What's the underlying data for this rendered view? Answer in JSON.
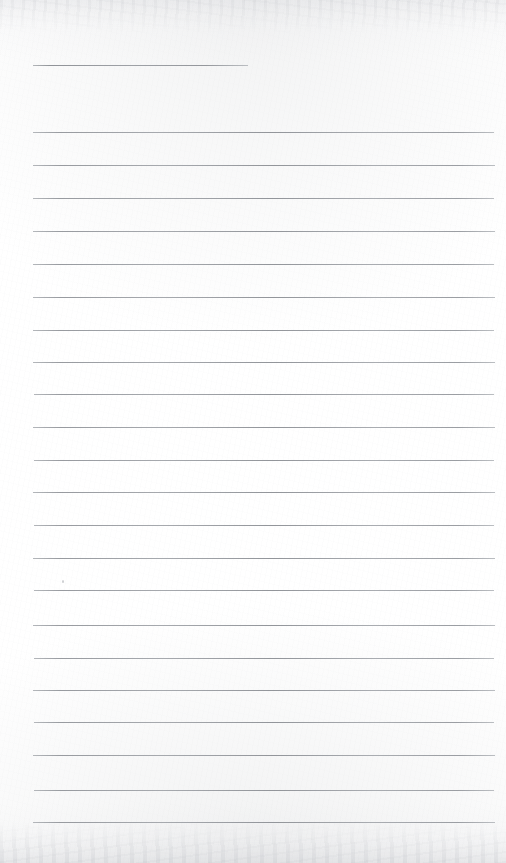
{
  "page": {
    "kind": "scanned-blank-lined-paper",
    "width": 506,
    "height": 863,
    "paper_color": "#fefefe",
    "rule_color": "#969ba0",
    "text_content": "",
    "notes_visible": "none"
  },
  "rules": {
    "count": 23,
    "left_x": 33,
    "right_x": 495,
    "spacing_px": 32.8,
    "lines": [
      {
        "id": "rule-1",
        "y": 65,
        "x1": 33,
        "x2": 248,
        "style": "short"
      },
      {
        "id": "rule-2",
        "y": 132,
        "x1": 33,
        "x2": 494,
        "style": "full"
      },
      {
        "id": "rule-3",
        "y": 165,
        "x1": 33,
        "x2": 495,
        "style": "full"
      },
      {
        "id": "rule-4",
        "y": 198,
        "x1": 33,
        "x2": 494,
        "style": "full"
      },
      {
        "id": "rule-5",
        "y": 231,
        "x1": 33,
        "x2": 495,
        "style": "full"
      },
      {
        "id": "rule-6",
        "y": 264,
        "x1": 33,
        "x2": 494,
        "style": "full"
      },
      {
        "id": "rule-7",
        "y": 297,
        "x1": 33,
        "x2": 495,
        "style": "full"
      },
      {
        "id": "rule-8",
        "y": 330,
        "x1": 33,
        "x2": 494,
        "style": "full"
      },
      {
        "id": "rule-9",
        "y": 362,
        "x1": 33,
        "x2": 495,
        "style": "full"
      },
      {
        "id": "rule-10",
        "y": 394,
        "x1": 34,
        "x2": 494,
        "style": "full"
      },
      {
        "id": "rule-11",
        "y": 427,
        "x1": 33,
        "x2": 495,
        "style": "full"
      },
      {
        "id": "rule-12",
        "y": 460,
        "x1": 34,
        "x2": 494,
        "style": "full"
      },
      {
        "id": "rule-13",
        "y": 492,
        "x1": 33,
        "x2": 495,
        "style": "full"
      },
      {
        "id": "rule-14",
        "y": 525,
        "x1": 34,
        "x2": 494,
        "style": "full"
      },
      {
        "id": "rule-15",
        "y": 558,
        "x1": 33,
        "x2": 495,
        "style": "full"
      },
      {
        "id": "rule-16",
        "y": 590,
        "x1": 34,
        "x2": 494,
        "style": "full"
      },
      {
        "id": "rule-17",
        "y": 625,
        "x1": 33,
        "x2": 495,
        "style": "full"
      },
      {
        "id": "rule-18",
        "y": 658,
        "x1": 34,
        "x2": 494,
        "style": "full"
      },
      {
        "id": "rule-19",
        "y": 690,
        "x1": 33,
        "x2": 495,
        "style": "full"
      },
      {
        "id": "rule-20",
        "y": 722,
        "x1": 34,
        "x2": 494,
        "style": "full"
      },
      {
        "id": "rule-21",
        "y": 755,
        "x1": 33,
        "x2": 495,
        "style": "full"
      },
      {
        "id": "rule-22",
        "y": 790,
        "x1": 34,
        "x2": 494,
        "style": "full"
      },
      {
        "id": "rule-23",
        "y": 822,
        "x1": 33,
        "x2": 495,
        "style": "full"
      }
    ]
  },
  "artifacts": {
    "speck": {
      "x": 62,
      "y": 580,
      "label": "paper-fleck"
    },
    "top_haze": {
      "height": 34,
      "label": "scanner-haze"
    },
    "bottom_haze": {
      "height": 42,
      "label": "scanner-shadow"
    }
  }
}
